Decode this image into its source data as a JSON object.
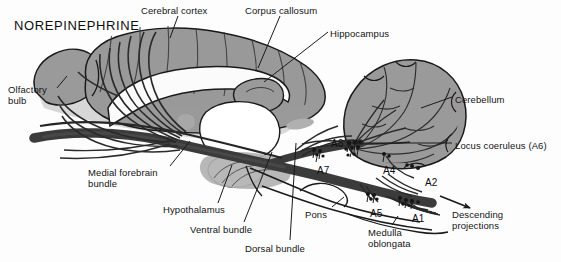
{
  "figure": {
    "title": "NOREPINEPHRINE",
    "background_color": "#fdfdfd",
    "tissue_fill": "#9a9a9a",
    "tract_color": "#3b3b3b",
    "outline_color": "#1a1a1a"
  },
  "structure_labels": [
    {
      "id": "cerebral-cortex",
      "text": "Cerebral cortex",
      "x": 141,
      "y": 5,
      "align": "left"
    },
    {
      "id": "corpus-callosum",
      "text": "Corpus callosum",
      "x": 245,
      "y": 5,
      "align": "left"
    },
    {
      "id": "hippocampus",
      "text": "Hippocampus",
      "x": 330,
      "y": 28,
      "align": "left"
    },
    {
      "id": "cerebellum",
      "text": "Cerebellum",
      "x": 455,
      "y": 94,
      "align": "left"
    },
    {
      "id": "olfactory-bulb",
      "text": "Olfactory\nbulb",
      "x": 8,
      "y": 84,
      "align": "left"
    },
    {
      "id": "locus-coeruleus",
      "text": "Locus coeruleus (A6)",
      "x": 455,
      "y": 140,
      "align": "left"
    },
    {
      "id": "medial-forebrain-bundle",
      "text": "Medial forebrain\n      bundle",
      "x": 88,
      "y": 167,
      "align": "left"
    },
    {
      "id": "hypothalamus",
      "text": "Hypothalamus",
      "x": 163,
      "y": 204,
      "align": "left"
    },
    {
      "id": "ventral-bundle",
      "text": "Ventral bundle",
      "x": 190,
      "y": 224,
      "align": "left"
    },
    {
      "id": "dorsal-bundle",
      "text": "Dorsal bundle",
      "x": 245,
      "y": 243,
      "align": "left"
    },
    {
      "id": "pons",
      "text": "Pons",
      "x": 305,
      "y": 209,
      "align": "left"
    },
    {
      "id": "medulla-oblongata",
      "text": "Medulla\noblongata",
      "x": 368,
      "y": 227,
      "align": "left"
    },
    {
      "id": "descending-projections",
      "text": "Descending\nprojections",
      "x": 452,
      "y": 209,
      "align": "left"
    }
  ],
  "cell_groups": [
    {
      "id": "A6",
      "text": "A6",
      "x": 331,
      "y": 138
    },
    {
      "id": "A7",
      "text": "A7",
      "x": 317,
      "y": 165
    },
    {
      "id": "A4",
      "text": "A4",
      "x": 383,
      "y": 165
    },
    {
      "id": "A2",
      "text": "A2",
      "x": 425,
      "y": 177
    },
    {
      "id": "A5",
      "text": "A5",
      "x": 370,
      "y": 208
    },
    {
      "id": "A1",
      "text": "A1",
      "x": 412,
      "y": 213
    }
  ],
  "cell_group_markers": [
    {
      "id": "A6-marker",
      "x": 353,
      "y": 146
    },
    {
      "id": "A7-marker",
      "x": 318,
      "y": 152
    },
    {
      "id": "A4-marker",
      "x": 385,
      "y": 155
    },
    {
      "id": "A2-marker",
      "x": 418,
      "y": 167
    },
    {
      "id": "A5-marker",
      "x": 372,
      "y": 196
    },
    {
      "id": "A1-marker",
      "x": 410,
      "y": 200
    }
  ],
  "leader_lines": [
    {
      "id": "cerebral-cortex-leader",
      "x1": 178,
      "y1": 16,
      "x2": 170,
      "y2": 38
    },
    {
      "id": "corpus-callosum-leader",
      "x1": 280,
      "y1": 16,
      "x2": 258,
      "y2": 68
    },
    {
      "id": "hippocampus-leader",
      "x1": 328,
      "y1": 32,
      "x2": 264,
      "y2": 82
    },
    {
      "id": "cerebellum-leader",
      "x1": 452,
      "y1": 97,
      "x2": 421,
      "y2": 108
    },
    {
      "id": "olfactory-bulb-leader",
      "x1": 57,
      "y1": 88,
      "x2": 67,
      "y2": 76
    },
    {
      "id": "locus-coeruleus-leader",
      "x1": 452,
      "y1": 143,
      "x2": 352,
      "y2": 143
    },
    {
      "id": "medial-forebrain-leader",
      "x1": 170,
      "y1": 166,
      "x2": 190,
      "y2": 141
    },
    {
      "id": "hypothalamus-leader",
      "x1": 218,
      "y1": 203,
      "x2": 232,
      "y2": 165
    },
    {
      "id": "ventral-bundle-leader",
      "x1": 244,
      "y1": 222,
      "x2": 272,
      "y2": 152
    },
    {
      "id": "dorsal-bundle-leader",
      "x1": 290,
      "y1": 240,
      "x2": 296,
      "y2": 143
    },
    {
      "id": "pons-leader",
      "x1": 332,
      "y1": 207,
      "x2": 344,
      "y2": 197
    },
    {
      "id": "medulla-leader",
      "x1": 392,
      "y1": 225,
      "x2": 398,
      "y2": 216
    }
  ],
  "descending_arrow": {
    "id": "descending-arrow",
    "x1": 440,
    "y1": 196,
    "x2": 470,
    "y2": 208
  }
}
